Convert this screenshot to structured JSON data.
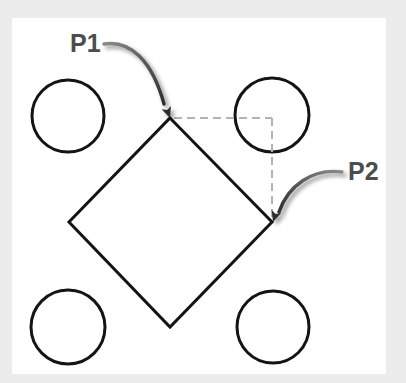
{
  "canvas": {
    "width": 406,
    "height": 383,
    "outer_background": "#f2f2f2",
    "panel_background": "#ffffff",
    "panel": {
      "x": 12,
      "y": 18,
      "width": 374,
      "height": 356
    }
  },
  "diagram": {
    "geometry_color": "#141414",
    "construction_color": "#b3b3b3",
    "annotation_color": "#4d4d4d",
    "shapes": {
      "square": {
        "name": "rotated-square",
        "stroke_width": 3,
        "vertices": [
          {
            "name": "top",
            "x": 170,
            "y": 118
          },
          {
            "name": "right",
            "x": 272,
            "y": 222
          },
          {
            "name": "bottom",
            "x": 170,
            "y": 327
          },
          {
            "name": "left",
            "x": 69,
            "y": 222
          }
        ]
      },
      "circles": [
        {
          "name": "circle-top-left",
          "cx": 68,
          "cy": 116,
          "r": 36,
          "stroke_width": 3
        },
        {
          "name": "circle-top-right",
          "cx": 272,
          "cy": 115,
          "r": 37,
          "stroke_width": 3
        },
        {
          "name": "circle-bottom-left",
          "cx": 68,
          "cy": 327,
          "r": 37,
          "stroke_width": 3
        },
        {
          "name": "circle-bottom-right",
          "cx": 273,
          "cy": 327,
          "r": 36,
          "stroke_width": 3
        }
      ],
      "construction_lines": [
        {
          "name": "horizontal-dashed-line",
          "x1": 174,
          "y1": 118,
          "x2": 272,
          "y2": 118,
          "dash": "8 5",
          "stroke_width": 2
        },
        {
          "name": "vertical-dashed-line",
          "x1": 272,
          "y1": 118,
          "x2": 272,
          "y2": 220,
          "dash": "8 5",
          "stroke_width": 2
        }
      ]
    },
    "annotations": [
      {
        "id": "p1",
        "label": "P1",
        "label_x": 70,
        "label_y": 45,
        "anchor": "start",
        "target_x": 170,
        "target_y": 118,
        "arrow_path": "M 104 44 C 130 40 152 60 164 104",
        "arrow_head_rotation": 70
      },
      {
        "id": "p2",
        "label": "P2",
        "label_x": 348,
        "label_y": 173,
        "anchor": "start",
        "target_x": 272,
        "target_y": 222,
        "arrow_path": "M 342 172 C 312 168 288 186 279 212",
        "arrow_head_rotation": 196
      }
    ]
  }
}
